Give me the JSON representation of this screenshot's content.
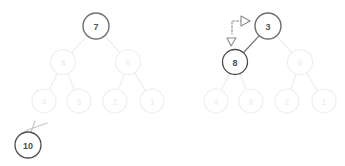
{
  "figure": {
    "background_color": "#ffffff",
    "width": 345,
    "height": 166
  },
  "colors": {
    "highlight_fill": "#c9c9c9",
    "highlight_stroke": "#6e6e6e",
    "highlight_text": "#555555",
    "active_fill": "#ffffff",
    "active_stroke": "#4d4d4d",
    "active_text": "#4d4d4d",
    "faded_stroke": "#ededed",
    "faded_text": "#f0f0f0",
    "edge_faded": "#ececec",
    "edge_active": "#777777",
    "cut_stroke": "#c6c6c6",
    "arrow_stroke": "#8a8a8a",
    "arrowhead_fill": "#ffffff"
  },
  "panels": [
    {
      "id": "left-panel",
      "name": "before-state",
      "nodes": [
        {
          "id": "L-root",
          "label": "7",
          "cx": 96,
          "cy": 26,
          "r": 13,
          "state": "highlight"
        },
        {
          "id": "L-n8",
          "label": "8",
          "cx": 63,
          "cy": 62,
          "r": 12.5,
          "state": "faded"
        },
        {
          "id": "L-n5",
          "label": "5",
          "cx": 128,
          "cy": 62,
          "r": 12.5,
          "state": "faded"
        },
        {
          "id": "L-n4",
          "label": "4",
          "cx": 44,
          "cy": 101,
          "r": 12,
          "state": "faded"
        },
        {
          "id": "L-n6",
          "label": "6",
          "cx": 79,
          "cy": 101,
          "r": 12,
          "state": "faded"
        },
        {
          "id": "L-n2",
          "label": "2",
          "cx": 115,
          "cy": 101,
          "r": 12,
          "state": "faded"
        },
        {
          "id": "L-n1",
          "label": "1",
          "cx": 152,
          "cy": 101,
          "r": 12,
          "state": "faded"
        },
        {
          "id": "L-n10",
          "label": "10",
          "cx": 28,
          "cy": 145,
          "r": 13,
          "state": "active"
        }
      ],
      "edges": [
        {
          "from": "L-root",
          "to": "L-n8",
          "state": "faded"
        },
        {
          "from": "L-root",
          "to": "L-n5",
          "state": "faded"
        },
        {
          "from": "L-n8",
          "to": "L-n4",
          "state": "faded"
        },
        {
          "from": "L-n8",
          "to": "L-n6",
          "state": "faded"
        },
        {
          "from": "L-n5",
          "to": "L-n2",
          "state": "faded"
        },
        {
          "from": "L-n5",
          "to": "L-n1",
          "state": "faded"
        }
      ],
      "cut_edge": {
        "name": "detached-edge-to-10",
        "line": {
          "x1": 25,
          "y1": 131,
          "x2": 47,
          "y2": 123
        },
        "slash": {
          "x1": 35,
          "y1": 121,
          "x2": 31,
          "y2": 132
        }
      },
      "annotations": []
    },
    {
      "id": "right-panel",
      "name": "after-state",
      "nodes": [
        {
          "id": "R-root",
          "label": "3",
          "cx": 268,
          "cy": 26,
          "r": 13,
          "state": "highlight"
        },
        {
          "id": "R-n8",
          "label": "8",
          "cx": 235,
          "cy": 62,
          "r": 12.5,
          "state": "active"
        },
        {
          "id": "R-n5",
          "label": "5",
          "cx": 300,
          "cy": 62,
          "r": 12.5,
          "state": "faded"
        },
        {
          "id": "R-n4",
          "label": "4",
          "cx": 216,
          "cy": 101,
          "r": 12,
          "state": "faded"
        },
        {
          "id": "R-n6",
          "label": "6",
          "cx": 251,
          "cy": 101,
          "r": 12,
          "state": "faded"
        },
        {
          "id": "R-n2",
          "label": "2",
          "cx": 287,
          "cy": 101,
          "r": 12,
          "state": "faded"
        },
        {
          "id": "R-n1",
          "label": "1",
          "cx": 324,
          "cy": 101,
          "r": 12,
          "state": "faded"
        }
      ],
      "edges": [
        {
          "from": "R-root",
          "to": "R-n8",
          "state": "active"
        },
        {
          "from": "R-root",
          "to": "R-n5",
          "state": "faded"
        },
        {
          "from": "R-n8",
          "to": "R-n4",
          "state": "faded"
        },
        {
          "from": "R-n8",
          "to": "R-n6",
          "state": "faded"
        },
        {
          "from": "R-n5",
          "to": "R-n2",
          "state": "faded"
        },
        {
          "from": "R-n5",
          "to": "R-n1",
          "state": "faded"
        }
      ],
      "swap_arrow": {
        "name": "swap-arrow",
        "style": "dotted",
        "path": "M 250 21 L 232 21 L 232 34",
        "head_top": {
          "points": "241,16 250,21 241,26",
          "label": "arrowhead-to-root"
        },
        "head_left": {
          "points": "227,38 236,38 231,46",
          "label": "arrowhead-to-child"
        }
      }
    }
  ]
}
